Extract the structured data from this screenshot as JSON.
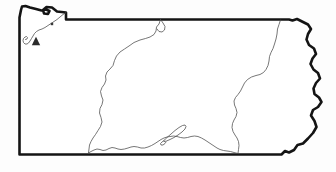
{
  "figure": {
    "kind": "outline-map",
    "caption": "",
    "background_color": "#fdfdfd",
    "width": 336,
    "height": 172
  },
  "styles": {
    "state_border_color": "#141414",
    "state_border_width": 2.6,
    "interior_line_color": "#4a4a4a",
    "interior_line_width": 0.75,
    "fill_color": "#ffffff",
    "marker_color": "#2b2b2b"
  },
  "layers": [
    {
      "id": "state-border",
      "name": "state-outline",
      "label": "",
      "stroke": "#141414"
    },
    {
      "id": "interior-north",
      "name": "northern-interior-divide",
      "label": "",
      "stroke": "#4a4a4a"
    },
    {
      "id": "interior-east",
      "name": "eastern-interior-divide",
      "label": "",
      "stroke": "#4a4a4a"
    },
    {
      "id": "interior-south",
      "name": "southern-interior-divide",
      "label": "",
      "stroke": "#4a4a4a"
    },
    {
      "id": "interior-erie",
      "name": "erie-shoreline-interior",
      "label": "",
      "stroke": "#4a4a4a"
    },
    {
      "id": "narrow-feature",
      "name": "elongated-water-feature",
      "label": "",
      "stroke": "#4a4a4a"
    }
  ],
  "markers": [
    {
      "id": "marker-triangle-nw",
      "name": "triangle-marker",
      "shape": "triangle",
      "x": 36,
      "y": 41,
      "size": 4.2,
      "color": "#2b2b2b",
      "label": ""
    },
    {
      "id": "marker-square-nw",
      "name": "square-marker",
      "shape": "square",
      "x": 52,
      "y": 24,
      "size": 2.4,
      "color": "#3a3a3a",
      "label": ""
    }
  ],
  "geometry": {
    "state_border_path": "M 19.5 17.5 L 19.5 154.5 L 281.5 154.5 L 285 151 L 289 152.5 L 294 150 L 297.5 145 L 303 143.5 L 308 138.5 L 313 133 L 316.5 127 L 314.5 121 L 311 115.5 L 313 110 L 318 107 L 321.5 102 L 319 97.5 L 314.5 94 L 313.5 88.5 L 316 83 L 320 78.5 L 318 73 L 313.5 69.5 L 310.5 64 L 312.5 58.5 L 316 54 L 314 48.5 L 309 45 L 306.5 39.5 L 308 34 L 311 29 L 308 24.5 L 302 21.5 L 297 19 L 292.5 20.5 L 289 19.5 L 66 19.5 L 66 12.5 L 57 11.5 L 52 7.5 L 46.5 7 L 43 10 L 44 13.5 L 48 14 L 49.5 11 L 46 9.5 L 41.5 10.5 L 36 9 L 30 7.5 L 25.5 6 L 22 6.5 L 21 10 Z",
    "interior_north_path": "M 160.5 19.5 L 159 24 L 156.5 27 L 156 31 L 154 34.5 L 150 37 L 145.5 38.5 L 140 40 L 134 42.5 L 129 46 L 124.5 49 L 120 52 L 116.5 56 L 114.5 60.5 L 113 65.5 L 110 69 L 107 72 L 105.5 76 L 106 80 L 104.5 84 L 102 87.5 L 100.5 91.5 L 101.5 96 L 103 100 L 102 104.5 L 100 108.5 L 99.5 113 L 101 117.5 L 102 122 L 100.5 126.5 L 98 130.5 L 95.5 134.5 L 93 138 L 91 141.5 L 89.5 145 L 89 149 L 88.5 153",
    "interior_north_branch_path": "M 160.5 19.5 L 163 23 L 165 26.5 L 164.5 30 L 162 32 L 159 31.5 L 157 29",
    "interior_east_path": "M 280.5 20 L 279 24.5 L 277.5 29 L 277 34 L 276 39 L 274.5 44 L 273 48.5 L 271 52.5 L 269.5 56.5 L 269 61 L 268 65.5 L 266 69.5 L 263.5 72.5 L 260 74.5 L 256 75.5 L 251.5 77 L 247.5 79.5 L 244.5 83 L 242.5 87 L 240.5 91 L 238 94.5 L 235.5 97.5 L 234 101 L 234.5 105 L 236 108.5 L 237 112.5 L 236 116.5 L 234 120 L 232.5 123.5 L 232 127.5 L 233 131.5 L 235 135 L 237 138 L 238.5 141.5 L 239 145.5 L 238.5 149.5 L 238 153.5",
    "interior_south_path": "M 88.5 153 L 91 151.5 L 94 150 L 97 149 L 100 149.5 L 103 150.5 L 106 150 L 109 148.5 L 112 147.5 L 115 148 L 118 149 L 121 149.5 L 124.5 149 L 128 148 L 131 147 L 134 146.5 L 137.5 147 L 141 148 L 144.5 148 L 148 147 L 151.5 145.5 L 155 143.5 L 158 141.5 L 161 139.5 L 164 138 L 167 137 L 170 136.5 L 173.5 136 L 177 136.5 L 180.5 137.5 L 184 138 L 187.5 137.5 L 191 136.5 L 194.5 136 L 198 136.5 L 201.5 138 L 205 140 L 208 142 L 211 144 L 214 146 L 217 148 L 220 149.5 L 223.5 150.5 L 227 151 L 230.5 151.5 L 234 152.5 L 238 153.5",
    "interior_erie_path": "M 66 12.5 L 63 14.5 L 60 17 L 57 19.5 L 54 21.5 L 51 23.5 L 48 25.5 L 45 27.5 L 42 29 L 39 30 L 36.5 31.5 L 34.5 33.5 L 33 36 L 31.5 38.5 L 30 41 L 28.5 43 L 27 44 L 25 44 L 23.5 42.5 L 23 40.5 L 23.5 38.5 L 25 37 L 26.5 36.5 L 27.5 37.5 L 27 39 L 25.5 39.5",
    "narrow_feature_path": "M 164 140.5 L 167 137.5 L 171 134 L 175 130.5 L 179 127.5 L 182.5 125.5 L 185 125 L 186 126.5 L 185 129 L 182 132 L 178 135 L 174 137.5 L 170 139.5 L 166.5 141 L 164.5 141.5 Z",
    "narrow_feature_tail_path": "M 164 140.5 L 162 142 L 160.5 143.5 L 161 145 L 163 145 L 165 143.5 L 166 142"
  }
}
